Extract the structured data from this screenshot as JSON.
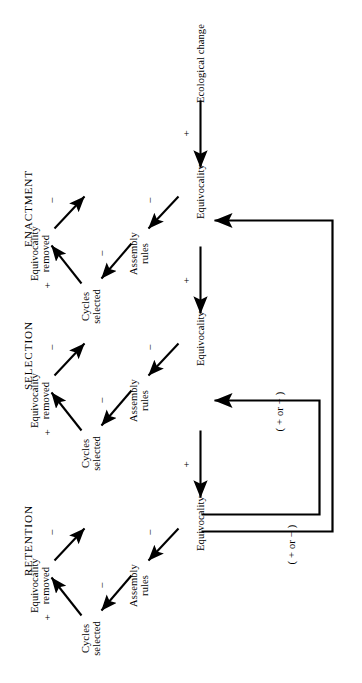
{
  "diagram": {
    "orientation": "rotated-90-ccw",
    "source_node": {
      "label": "Ecological change"
    },
    "stages": [
      {
        "id": "enactment",
        "stage_label": "ENACTMENT",
        "nodes": {
          "equivocality": "Equivocality",
          "assembly_rules": "Assembly\nrules",
          "cycles_selected": "Cycles\nselected",
          "equivocality_removed": "Equivocality\nremoved"
        },
        "signs": {
          "equivocality_to_assembly_rules": "−",
          "assembly_rules_to_cycles_selected": "−",
          "cycles_selected_to_equivocality_removed": "+",
          "equivocality_removed_to_equivocality": "−"
        },
        "incoming_sign": "+"
      },
      {
        "id": "selection",
        "stage_label": "SELECTION",
        "nodes": {
          "equivocality": "Equivocality",
          "assembly_rules": "Assembly\nrules",
          "cycles_selected": "Cycles\nselected",
          "equivocality_removed": "Equivocality\nremoved"
        },
        "signs": {
          "equivocality_to_assembly_rules": "−",
          "assembly_rules_to_cycles_selected": "−",
          "cycles_selected_to_equivocality_removed": "+",
          "equivocality_removed_to_equivocality": "−"
        },
        "incoming_sign": "+"
      },
      {
        "id": "retention",
        "stage_label": "RETENTION",
        "nodes": {
          "equivocality": "Equivocality",
          "assembly_rules": "Assembly\nrules",
          "cycles_selected": "Cycles\nselected",
          "equivocality_removed": "Equivocality\nremoved"
        },
        "signs": {
          "equivocality_to_assembly_rules": "−",
          "assembly_rules_to_cycles_selected": "−",
          "cycles_selected_to_equivocality_removed": "+",
          "equivocality_removed_to_equivocality": "−"
        },
        "incoming_sign": "+"
      }
    ],
    "feedback_loops": [
      {
        "id": "retention-to-enactment",
        "label": "( + or − )",
        "from": "retention.equivocality",
        "to": "enactment.equivocality"
      },
      {
        "id": "retention-to-selection",
        "label": "( + or − )",
        "from": "retention.equivocality",
        "to": "selection.equivocality"
      }
    ],
    "colors": {
      "ink": "#000000",
      "background": "#ffffff"
    }
  }
}
